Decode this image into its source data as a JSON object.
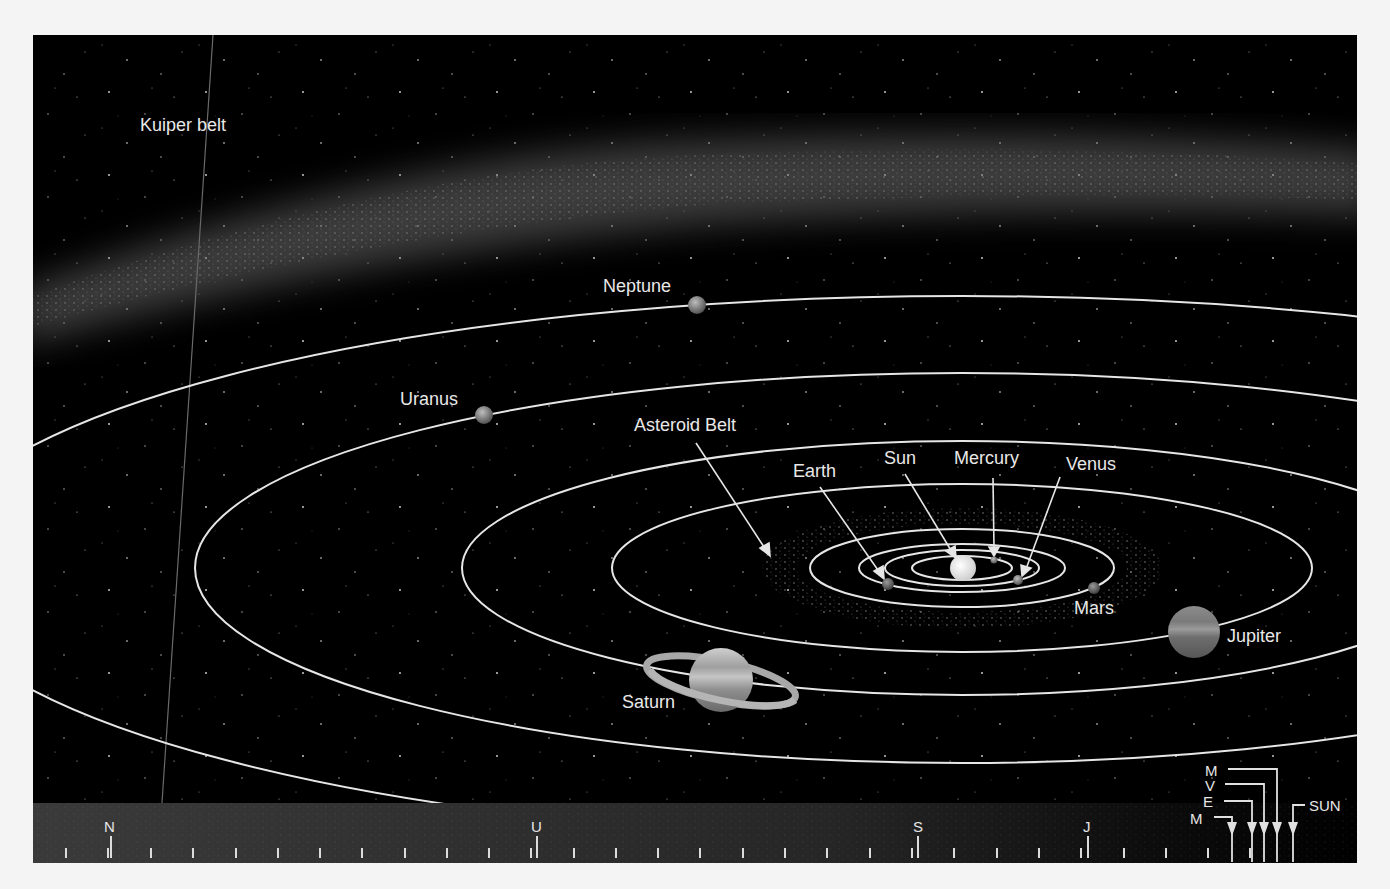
{
  "figure": {
    "background": "#000000",
    "orbit_color": "#e8e8e8",
    "labels": {
      "kuiper_belt": "Kuiper belt",
      "neptune": "Neptune",
      "uranus": "Uranus",
      "asteroid_belt": "Asteroid Belt",
      "earth": "Earth",
      "sun": "Sun",
      "mercury": "Mercury",
      "venus": "Venus",
      "mars": "Mars",
      "jupiter": "Jupiter",
      "saturn": "Saturn"
    },
    "scale_bar": {
      "markers": {
        "neptune": "N",
        "uranus": "U",
        "saturn": "S",
        "jupiter": "J",
        "mars": "M",
        "venus": "V",
        "earth": "E",
        "mercury": "M",
        "sun": "SUN"
      }
    }
  }
}
